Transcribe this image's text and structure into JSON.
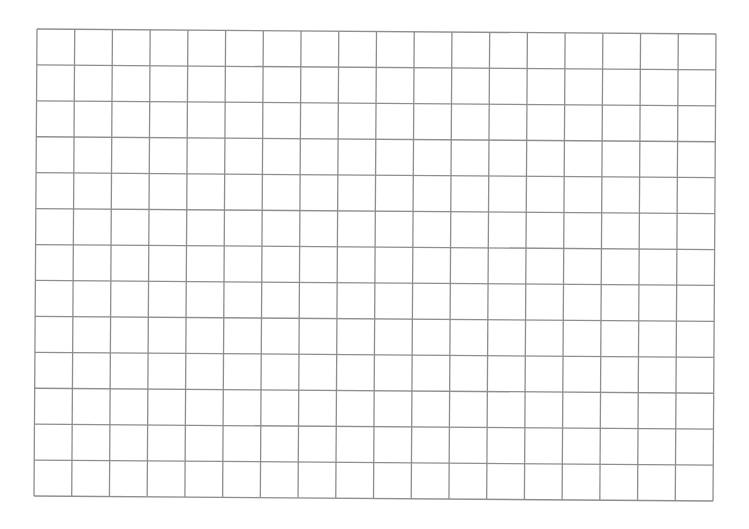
{
  "page": {
    "background": "#ffffff"
  },
  "grid": {
    "columns": 18,
    "rows": 13,
    "line_color": "#8e8e8e",
    "corners": {
      "top_left": [
        37,
        29
      ],
      "top_right": [
        716,
        34
      ],
      "bottom_left": [
        34,
        496
      ],
      "bottom_right": [
        713,
        501
      ]
    }
  }
}
